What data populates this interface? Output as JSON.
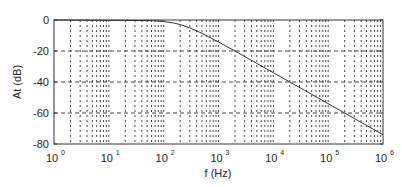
{
  "chart_data": {
    "type": "line",
    "title": "",
    "xlabel": "f (Hz)",
    "ylabel": "At (dB)",
    "xscale": "log",
    "xlim": [
      1,
      1000000
    ],
    "ylim": [
      -80,
      0
    ],
    "grid": true,
    "legend": null,
    "x_ticks": [
      {
        "value": 1,
        "base": "10",
        "exp": "0"
      },
      {
        "value": 10,
        "base": "10",
        "exp": "1"
      },
      {
        "value": 100,
        "base": "10",
        "exp": "2"
      },
      {
        "value": 1000,
        "base": "10",
        "exp": "3"
      },
      {
        "value": 10000,
        "base": "10",
        "exp": "4"
      },
      {
        "value": 100000,
        "base": "10",
        "exp": "5"
      },
      {
        "value": 1000000,
        "base": "10",
        "exp": "6"
      }
    ],
    "y_ticks": [
      0,
      -20,
      -40,
      -60,
      -80
    ],
    "series": [
      {
        "name": "At",
        "color": "#333333",
        "x": [
          100,
          150,
          200,
          300,
          500,
          1000,
          2000,
          5000,
          10000,
          20000,
          50000,
          100000,
          200000,
          500000,
          1000000
        ],
        "y": [
          -1.0,
          -1.9,
          -3.0,
          -5.1,
          -8.6,
          -14.2,
          -20.0,
          -28.0,
          -34.0,
          -40.0,
          -48.0,
          -54.0,
          -60.0,
          -68.0,
          -74.0
        ]
      }
    ]
  }
}
